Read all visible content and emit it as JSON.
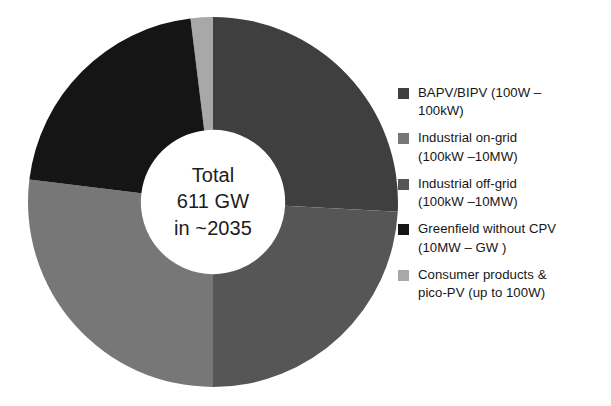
{
  "center_text": {
    "line1": "Total",
    "line2": "611 GW",
    "line3": "in ~2035"
  },
  "legend": {
    "items": [
      {
        "label": "BAPV/BIPV (100W –\n100kW)",
        "color": "#3f3f3f"
      },
      {
        "label": "Industrial on-grid\n(100kW –10MW)",
        "color": "#777777"
      },
      {
        "label": "Industrial off-grid\n(100kW –10MW)",
        "color": "#565656"
      },
      {
        "label": "Greenfield without CPV\n(10MW – GW )",
        "color": "#151515"
      },
      {
        "label": "Consumer products &\npico-PV (up to 100W)",
        "color": "#a8a8a8"
      }
    ]
  },
  "chart_data": {
    "type": "pie",
    "title": "",
    "subtitle": "",
    "total": 611,
    "total_unit": "GW",
    "total_year": "~2035",
    "hole_ratio": 0.39,
    "start_angle_deg": 353,
    "direction": "clockwise",
    "legend_position": "right",
    "categories": [
      "BAPV/BIPV (100W – 100kW)",
      "Industrial off-grid (100kW –10MW)",
      "Industrial on-grid (100kW –10MW)",
      "Greenfield without CPV (10MW – GW )",
      "Consumer products & pico-PV (up to 100W)"
    ],
    "values": [
      159,
      147,
      165,
      128,
      12
    ],
    "percentages": [
      26.0,
      24.0,
      27.0,
      21.0,
      2.0
    ],
    "colors": [
      "#3f3f3f",
      "#565656",
      "#777777",
      "#151515",
      "#a8a8a8"
    ],
    "segments": [
      {
        "name": "Consumer products & pico-PV (up to 100W)",
        "value": 12,
        "percent": 2.0,
        "color": "#a8a8a8",
        "start_deg": 353,
        "end_deg": 360
      },
      {
        "name": "BAPV/BIPV (100W – 100kW)",
        "value": 159,
        "percent": 26.0,
        "color": "#3f3f3f",
        "start_deg": 0,
        "end_deg": 93
      },
      {
        "name": "Industrial off-grid (100kW –10MW)",
        "value": 147,
        "percent": 24.0,
        "color": "#565656",
        "start_deg": 93,
        "end_deg": 180
      },
      {
        "name": "Industrial on-grid (100kW –10MW)",
        "value": 165,
        "percent": 27.0,
        "color": "#777777",
        "start_deg": 180,
        "end_deg": 277
      },
      {
        "name": "Greenfield without CPV (10MW – GW )",
        "value": 128,
        "percent": 21.0,
        "color": "#151515",
        "start_deg": 277,
        "end_deg": 353
      }
    ]
  }
}
